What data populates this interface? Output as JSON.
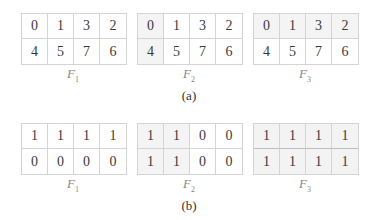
{
  "panels": [
    {
      "caption": "(a)",
      "grids": [
        {
          "label": "F",
          "sub": "1",
          "rows": [
            [
              "0",
              "1",
              "3",
              "2"
            ],
            [
              "4",
              "5",
              "7",
              "6"
            ]
          ]
        },
        {
          "label": "F",
          "sub": "2",
          "rows": [
            [
              "0",
              "1",
              "3",
              "2"
            ],
            [
              "4",
              "5",
              "7",
              "6"
            ]
          ]
        },
        {
          "label": "F",
          "sub": "3",
          "rows": [
            [
              "0",
              "1",
              "3",
              "2"
            ],
            [
              "4",
              "5",
              "7",
              "6"
            ]
          ]
        }
      ]
    },
    {
      "caption": "(b)",
      "grids": [
        {
          "label": "F",
          "sub": "1",
          "rows": [
            [
              "1",
              "1",
              "1",
              "1"
            ],
            [
              "0",
              "0",
              "0",
              "0"
            ]
          ]
        },
        {
          "label": "F",
          "sub": "2",
          "rows": [
            [
              "1",
              "1",
              "0",
              "0"
            ],
            [
              "1",
              "1",
              "0",
              "0"
            ]
          ]
        },
        {
          "label": "F",
          "sub": "3",
          "rows": [
            [
              "1",
              "1",
              "1",
              "1"
            ],
            [
              "1",
              "1",
              "1",
              "1"
            ]
          ]
        }
      ]
    }
  ]
}
